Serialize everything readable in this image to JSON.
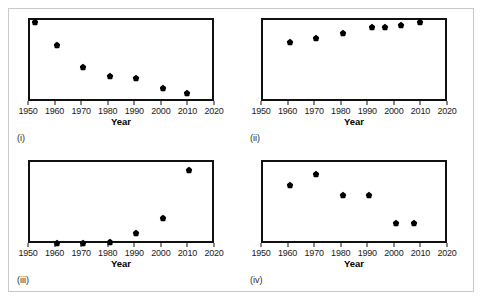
{
  "figure": {
    "caption_i": "(i)",
    "caption_ii": "(ii)",
    "caption_iii": "(iii)",
    "caption_iv": "(iv)",
    "axis_title": "Year",
    "tick_labels": [
      "1950",
      "1960",
      "1970",
      "1980",
      "1990",
      "2000",
      "2010",
      "2020"
    ],
    "frame_color": "#c9c9c9",
    "axis_color": "#111111",
    "marker_color": "#000000"
  },
  "chart_data": [
    {
      "type": "scatter",
      "title": "(i)",
      "xlabel": "Year",
      "ylabel": "",
      "xlim": [
        1950,
        2020
      ],
      "ylim": [
        0,
        1
      ],
      "grid": false,
      "legend": "none",
      "x": [
        1952,
        1960,
        1970,
        1980,
        1990,
        2000,
        2009
      ],
      "y": [
        0.97,
        0.7,
        0.43,
        0.33,
        0.3,
        0.18,
        0.12
      ],
      "description": "Decreasing trend, steep early decline then flattening"
    },
    {
      "type": "scatter",
      "title": "(ii)",
      "xlabel": "Year",
      "ylabel": "",
      "xlim": [
        1950,
        2020
      ],
      "ylim": [
        0,
        1
      ],
      "grid": false,
      "legend": "none",
      "x": [
        1960,
        1970,
        1980,
        1991,
        1996,
        2002,
        2009
      ],
      "y": [
        0.73,
        0.78,
        0.84,
        0.91,
        0.92,
        0.94,
        0.97
      ],
      "description": "Increasing trend, rising then levelling off near top"
    },
    {
      "type": "scatter",
      "title": "(iii)",
      "xlabel": "Year",
      "ylabel": "",
      "xlim": [
        1950,
        2020
      ],
      "ylim": [
        0,
        1
      ],
      "grid": false,
      "legend": "none",
      "x": [
        1960,
        1970,
        1980,
        1990,
        2000,
        2010
      ],
      "y": [
        0.02,
        0.02,
        0.04,
        0.15,
        0.32,
        0.9
      ],
      "description": "Exponential growth, flat until 1980 then sharp rise"
    },
    {
      "type": "scatter",
      "title": "(iv)",
      "xlabel": "Year",
      "ylabel": "",
      "xlim": [
        1950,
        2020
      ],
      "ylim": [
        0,
        1
      ],
      "grid": false,
      "legend": "none",
      "x": [
        1960,
        1970,
        1980,
        1990,
        2000,
        2007
      ],
      "y": [
        0.72,
        0.86,
        0.6,
        0.6,
        0.26,
        0.26
      ],
      "description": "Rise to peak at 1970 then step-wise decline"
    }
  ]
}
